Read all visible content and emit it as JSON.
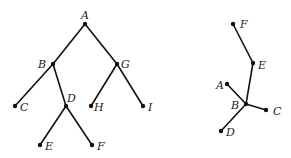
{
  "diagram": {
    "type": "trees",
    "colors": {
      "edge": "#111111",
      "node": "#111111",
      "label": "#222222"
    },
    "trees": [
      {
        "name": "rooted-binary-tree",
        "nodes": [
          {
            "id": "A",
            "label": "A",
            "x": 85,
            "y": 24,
            "lx": 81,
            "ly": 19
          },
          {
            "id": "B",
            "label": "B",
            "x": 53,
            "y": 64,
            "lx": 38,
            "ly": 68
          },
          {
            "id": "G",
            "label": "G",
            "x": 117,
            "y": 64,
            "lx": 121,
            "ly": 68
          },
          {
            "id": "C",
            "label": "C",
            "x": 15,
            "y": 106,
            "lx": 20,
            "ly": 111
          },
          {
            "id": "D",
            "label": "D",
            "x": 66,
            "y": 106,
            "lx": 67,
            "ly": 102
          },
          {
            "id": "H",
            "label": "H",
            "x": 91,
            "y": 106,
            "lx": 94,
            "ly": 111
          },
          {
            "id": "I",
            "label": "I",
            "x": 143,
            "y": 106,
            "lx": 148,
            "ly": 111
          },
          {
            "id": "E",
            "label": "E",
            "x": 40,
            "y": 145,
            "lx": 45,
            "ly": 150
          },
          {
            "id": "F",
            "label": "F",
            "x": 92,
            "y": 145,
            "lx": 97,
            "ly": 150
          }
        ],
        "edges": [
          [
            "A",
            "B"
          ],
          [
            "A",
            "G"
          ],
          [
            "B",
            "C"
          ],
          [
            "B",
            "D"
          ],
          [
            "G",
            "H"
          ],
          [
            "G",
            "I"
          ],
          [
            "D",
            "E"
          ],
          [
            "D",
            "F"
          ]
        ]
      },
      {
        "name": "unrooted-tree",
        "nodes": [
          {
            "id": "F",
            "label": "F",
            "x": 233,
            "y": 24,
            "lx": 240,
            "ly": 28
          },
          {
            "id": "E",
            "label": "E",
            "x": 253,
            "y": 63,
            "lx": 258,
            "ly": 69
          },
          {
            "id": "A",
            "label": "A",
            "x": 227,
            "y": 84,
            "lx": 216,
            "ly": 89
          },
          {
            "id": "B",
            "label": "B",
            "x": 246,
            "y": 104,
            "lx": 231,
            "ly": 109
          },
          {
            "id": "C",
            "label": "C",
            "x": 266,
            "y": 110,
            "lx": 273,
            "ly": 115
          },
          {
            "id": "D",
            "label": "D",
            "x": 221,
            "y": 131,
            "lx": 226,
            "ly": 136
          }
        ],
        "edges": [
          [
            "F",
            "E"
          ],
          [
            "E",
            "B"
          ],
          [
            "A",
            "B"
          ],
          [
            "B",
            "C"
          ],
          [
            "B",
            "D"
          ]
        ]
      }
    ]
  }
}
